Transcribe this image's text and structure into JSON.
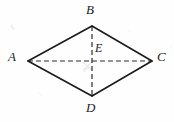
{
  "figure": {
    "type": "geometry-diagram",
    "shape": "rhombus",
    "canvas": {
      "width": 174,
      "height": 122,
      "background": "#fefefe"
    },
    "colors": {
      "edge": "#1b1b1b",
      "diagonal": "#2b2b2b",
      "label": "#1b1b1b",
      "artifact": "#d8d8d8"
    },
    "vertices": [
      {
        "id": "A",
        "label": "A",
        "x": 28,
        "y": 61,
        "label_x": 8,
        "label_y": 50,
        "role": "left-vertex"
      },
      {
        "id": "B",
        "label": "B",
        "x": 92,
        "y": 26,
        "label_x": 86,
        "label_y": 3,
        "role": "top-vertex"
      },
      {
        "id": "C",
        "label": "C",
        "x": 152,
        "y": 61,
        "label_x": 157,
        "label_y": 50,
        "role": "right-vertex"
      },
      {
        "id": "D",
        "label": "D",
        "x": 92,
        "y": 96,
        "label_x": 86,
        "label_y": 101,
        "role": "bottom-vertex"
      },
      {
        "id": "E",
        "label": "E",
        "x": 92,
        "y": 61,
        "label_x": 95,
        "label_y": 42,
        "role": "diagonal-intersection"
      }
    ],
    "edges": [
      {
        "id": "AB",
        "from": "A",
        "to": "B",
        "style": "solid"
      },
      {
        "id": "BC",
        "from": "B",
        "to": "C",
        "style": "solid"
      },
      {
        "id": "CD",
        "from": "C",
        "to": "D",
        "style": "solid"
      },
      {
        "id": "DA",
        "from": "D",
        "to": "A",
        "style": "solid"
      }
    ],
    "diagonals": [
      {
        "id": "AC",
        "from": "A",
        "to": "C",
        "style": "dashed",
        "orientation": "horizontal"
      },
      {
        "id": "BD",
        "from": "B",
        "to": "D",
        "style": "dashed",
        "orientation": "vertical"
      }
    ],
    "dash_pattern": "5 3"
  }
}
